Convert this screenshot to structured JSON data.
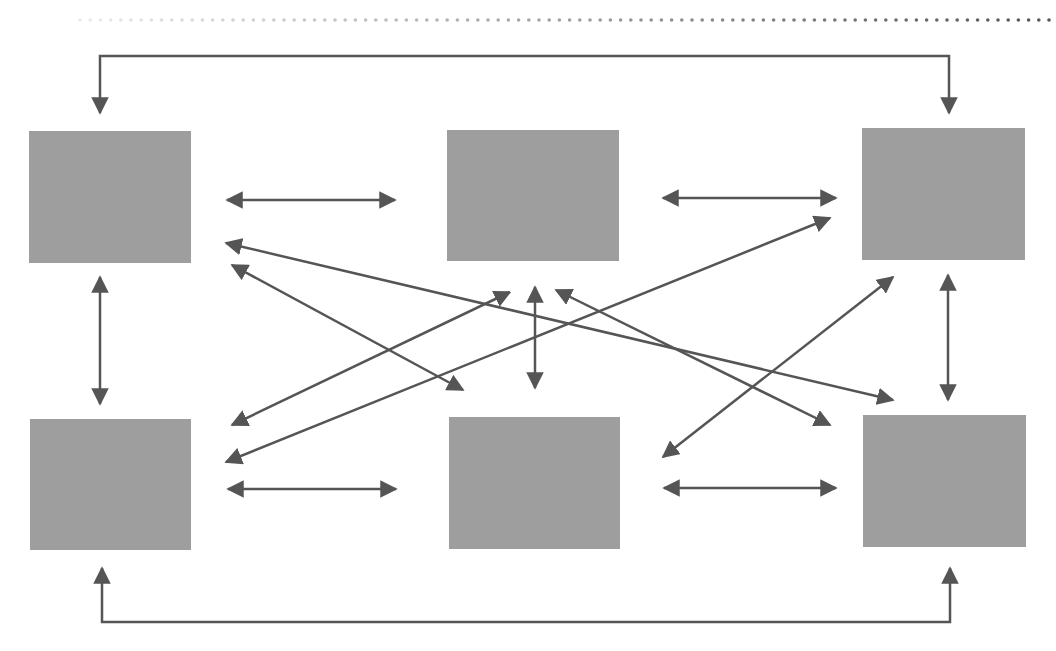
{
  "diagram": {
    "title_fragment": "",
    "colors": {
      "node_fill": "#9e9e9e",
      "arrow": "#555555",
      "background": "#ffffff"
    },
    "dotted_rule": {
      "y": 20,
      "x_start": 80,
      "x_end": 1050,
      "spacing": 10.2
    },
    "nodes": [
      {
        "id": "top-left",
        "x": 29,
        "y": 131,
        "w": 162,
        "h": 132
      },
      {
        "id": "top-middle",
        "x": 447,
        "y": 130,
        "w": 172,
        "h": 131
      },
      {
        "id": "top-right",
        "x": 862,
        "y": 128,
        "w": 163,
        "h": 132
      },
      {
        "id": "bottom-left",
        "x": 30,
        "y": 419,
        "w": 161,
        "h": 131
      },
      {
        "id": "bottom-middle",
        "x": 449,
        "y": 417,
        "w": 171,
        "h": 132
      },
      {
        "id": "bottom-right",
        "x": 863,
        "y": 415,
        "w": 163,
        "h": 132
      }
    ],
    "brackets": [
      {
        "id": "top-bracket",
        "points": [
          [
            100,
            113
          ],
          [
            100,
            56
          ],
          [
            949,
            56
          ],
          [
            949,
            113
          ]
        ],
        "arrow_ends": [
          "start",
          "end"
        ]
      },
      {
        "id": "bottom-bracket",
        "points": [
          [
            102,
            568
          ],
          [
            102,
            622
          ],
          [
            950,
            622
          ],
          [
            950,
            568
          ]
        ],
        "arrow_ends": [
          "start",
          "end"
        ]
      }
    ],
    "connections": [
      {
        "id": "tl-tm",
        "from": [
          227,
          200
        ],
        "to": [
          395,
          200
        ]
      },
      {
        "id": "tm-tr",
        "from": [
          663,
          198
        ],
        "to": [
          836,
          198
        ]
      },
      {
        "id": "bl-bm",
        "from": [
          228,
          489
        ],
        "to": [
          396,
          489
        ]
      },
      {
        "id": "bm-br",
        "from": [
          664,
          488
        ],
        "to": [
          836,
          488
        ]
      },
      {
        "id": "tl-bl",
        "from": [
          100,
          277
        ],
        "to": [
          100,
          404
        ]
      },
      {
        "id": "tm-bm",
        "from": [
          535,
          287
        ],
        "to": [
          535,
          388
        ]
      },
      {
        "id": "tr-br",
        "from": [
          948,
          275
        ],
        "to": [
          948,
          400
        ]
      },
      {
        "id": "tl-br",
        "from": [
          226,
          243
        ],
        "to": [
          893,
          400
        ]
      },
      {
        "id": "tl-bm",
        "from": [
          232,
          265
        ],
        "to": [
          463,
          390
        ]
      },
      {
        "id": "bl-tm",
        "from": [
          232,
          425
        ],
        "to": [
          510,
          292
        ]
      },
      {
        "id": "bl-tr",
        "from": [
          226,
          462
        ],
        "to": [
          830,
          218
        ]
      },
      {
        "id": "tm-br",
        "from": [
          556,
          290
        ],
        "to": [
          830,
          425
        ]
      },
      {
        "id": "bm-tr",
        "from": [
          663,
          457
        ],
        "to": [
          893,
          277
        ]
      }
    ]
  }
}
